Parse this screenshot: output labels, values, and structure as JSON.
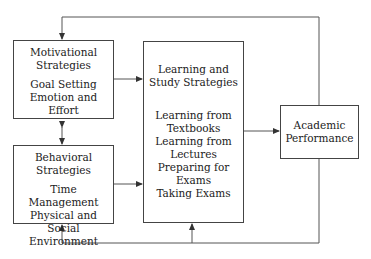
{
  "diagram": {
    "motivational": {
      "title": [
        "Motivational",
        "Strategies"
      ],
      "items": [
        "Goal Setting",
        "Emotion and",
        "Effort"
      ]
    },
    "behavioral": {
      "title": [
        "Behavioral",
        "Strategies"
      ],
      "items": [
        "Time Management",
        "Physical and Social",
        "Environment"
      ]
    },
    "learning": {
      "title": [
        "Learning and",
        "Study Strategies"
      ],
      "items": [
        "Learning from",
        "Textbooks",
        "Learning from",
        "Lectures",
        "Preparing for",
        "Exams",
        "Taking Exams"
      ]
    },
    "academic": {
      "title": [
        "Academic",
        "Performance"
      ]
    },
    "colors": {
      "line": "#444444",
      "text": "#222222"
    }
  }
}
